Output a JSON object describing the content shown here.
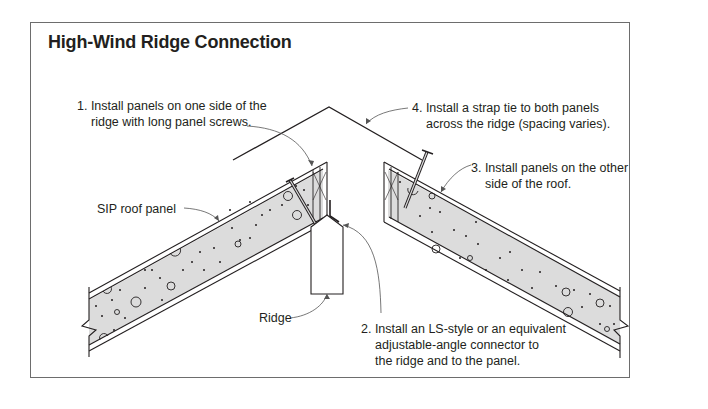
{
  "title": "High-Wind Ridge Connection",
  "callouts": {
    "step1": {
      "lines": [
        "1. Install panels on one side of the",
        "ridge with long panel screws."
      ]
    },
    "step2": {
      "lines": [
        "2. Install an LS-style or an equivalent",
        "adjustable-angle connector to",
        "the ridge and to the panel."
      ]
    },
    "step3": {
      "lines": [
        "3. Install panels on the other",
        "side of the roof."
      ]
    },
    "step4": {
      "lines": [
        "4. Install a strap tie to both panels",
        "across the ridge (spacing varies)."
      ]
    }
  },
  "labels": {
    "sip_panel": "SIP roof panel",
    "ridge": "Ridge"
  },
  "colors": {
    "foam_fill": "#dcdcdc",
    "line": "#231f20",
    "frame": "#6d6d6d",
    "leader": "#555555"
  }
}
